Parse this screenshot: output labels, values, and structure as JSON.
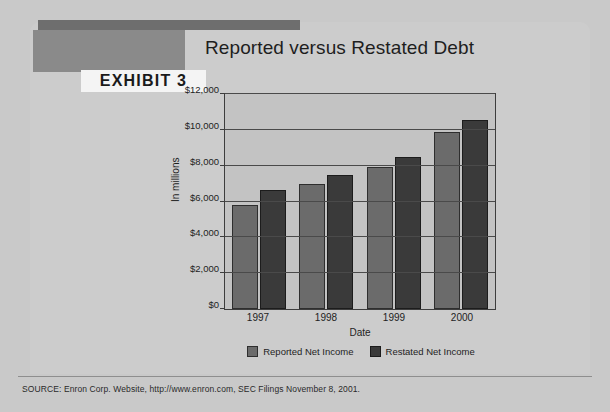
{
  "exhibit": {
    "label": "EXHIBIT 3",
    "title": "Reported versus Restated Debt"
  },
  "source": {
    "text": "SOURCE: Enron Corp. Website, http://www.enron.com, SEC Filings November 8, 2001."
  },
  "colors": {
    "reported": "#6b6b6b",
    "restated": "#3a3a3a",
    "plot_background": "#c3c3c3",
    "page_background": "#c9c9c9",
    "exhibit_bar": "#8a8a8a",
    "top_rule": "#6e6e6e"
  },
  "chart_data": {
    "type": "bar",
    "title": "Reported versus Restated Debt",
    "xlabel": "Date",
    "ylabel": "In millions",
    "categories": [
      "1997",
      "1998",
      "1999",
      "2000"
    ],
    "series": [
      {
        "name": "Reported Net Income",
        "values": [
          5800,
          7000,
          7900,
          9900
        ]
      },
      {
        "name": "Restated Net Income",
        "values": [
          6650,
          7500,
          8500,
          10550
        ]
      }
    ],
    "ylim": [
      0,
      12000
    ],
    "ytick_values": [
      0,
      2000,
      4000,
      6000,
      8000,
      10000,
      12000
    ],
    "ytick_labels": [
      "$0",
      "$2,000",
      "$4,000",
      "$6,000",
      "$8,000",
      "$10,000",
      "$12,000"
    ],
    "grid": true,
    "legend_position": "bottom"
  }
}
